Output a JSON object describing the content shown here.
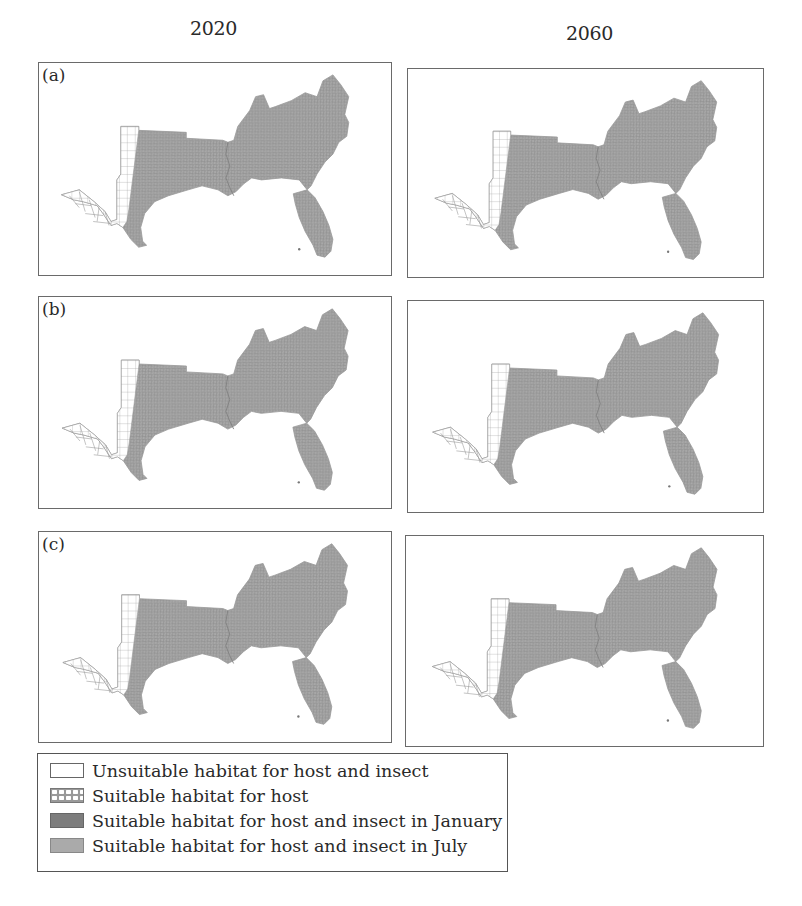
{
  "figure": {
    "columns": [
      {
        "year": "2020"
      },
      {
        "year": "2060"
      }
    ],
    "rows": [
      {
        "label": "(a)"
      },
      {
        "label": "(b)"
      },
      {
        "label": "(c)"
      }
    ],
    "map_region": "Southern United States (county-level)",
    "colors": {
      "unsuitable": "#ffffff",
      "host_only_hatch": "#999999",
      "january": "#7d7d7d",
      "july": "#aaaaaa",
      "county_lines": "#8a8a8a",
      "border": "#6a6a6a"
    }
  },
  "legend": {
    "items": [
      {
        "swatch": "unsuitable",
        "label": "Unsuitable habitat for host and insect"
      },
      {
        "swatch": "host",
        "label": "Suitable habitat for host"
      },
      {
        "swatch": "january",
        "label": "Suitable habitat for host and insect in January"
      },
      {
        "swatch": "july",
        "label": "Suitable habitat for host and insect in July"
      }
    ]
  }
}
